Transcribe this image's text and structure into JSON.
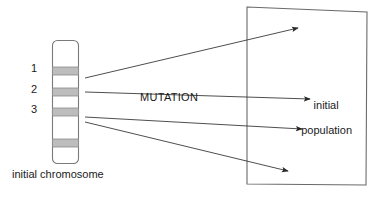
{
  "diagram": {
    "title_text": "MUTATION",
    "chromosome": {
      "caption": "initial chromosome",
      "band_labels": [
        "1",
        "2",
        "3"
      ],
      "geometry": {
        "x": 52,
        "y": 40,
        "width": 26,
        "height": 123,
        "corner_radius": 5
      },
      "bands": [
        {
          "label": "1",
          "y": 67,
          "height": 8,
          "color": "#b9b9b9",
          "labeled": true
        },
        {
          "label": "2",
          "y": 88,
          "height": 8,
          "color": "#b9b9b9",
          "labeled": true
        },
        {
          "label": "3",
          "y": 108,
          "height": 8,
          "color": "#b9b9b9",
          "labeled": true
        },
        {
          "label": "",
          "y": 139,
          "height": 8,
          "color": "#b9b9b9",
          "labeled": false
        }
      ]
    },
    "population_box": {
      "label_line_1": "initial",
      "label_line_2": "population",
      "geometry": {
        "top_left": [
          247,
          7
        ],
        "top_right": [
          367,
          12
        ],
        "bottom_right": [
          366,
          185
        ],
        "bottom_left": [
          247,
          184
        ]
      }
    },
    "arrows": [
      {
        "from": [
          85,
          78
        ],
        "to": [
          298,
          28
        ],
        "name": "mutation-arrow-1"
      },
      {
        "from": [
          85,
          92
        ],
        "to": [
          310,
          99
        ],
        "name": "mutation-arrow-2"
      },
      {
        "from": [
          85,
          117
        ],
        "to": [
          302,
          129
        ],
        "name": "mutation-arrow-3"
      },
      {
        "from": [
          85,
          122
        ],
        "to": [
          288,
          171
        ],
        "name": "mutation-arrow-4"
      }
    ],
    "colors": {
      "stroke": "#3a3a3a",
      "band_fill": "#b9b9b9",
      "box_stroke": "#5a5a5a",
      "text": "#1a1a1a",
      "background": "#ffffff"
    }
  }
}
